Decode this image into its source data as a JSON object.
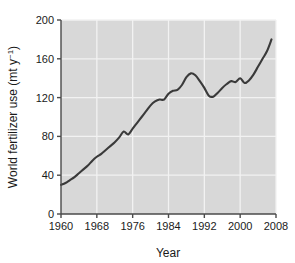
{
  "chart_data": {
    "type": "line",
    "title": "",
    "xlabel": "Year",
    "ylabel": "World fertilizer use (mt y-1)",
    "ylabel_main": "World fertilizer use (mt y",
    "ylabel_sup": "−1",
    "ylabel_close": ")",
    "xlim": [
      1960,
      2008
    ],
    "ylim": [
      0,
      200
    ],
    "grid": true,
    "legend": null,
    "xticks": [
      1960,
      1968,
      1976,
      1984,
      1992,
      2000,
      2008
    ],
    "xtick_labels": [
      "1960",
      "1968",
      "1976",
      "1984",
      "1992",
      "2000",
      "2008"
    ],
    "yticks": [
      0,
      40,
      80,
      120,
      160,
      200
    ],
    "ytick_labels": [
      "0",
      "40",
      "80",
      "120",
      "160",
      "200"
    ],
    "series": [
      {
        "name": "World fertilizer use",
        "color": "#3a3a3a",
        "x": [
          1960,
          1961,
          1962,
          1963,
          1964,
          1965,
          1966,
          1967,
          1968,
          1969,
          1970,
          1971,
          1972,
          1973,
          1974,
          1975,
          1976,
          1977,
          1978,
          1979,
          1980,
          1981,
          1982,
          1983,
          1984,
          1985,
          1986,
          1987,
          1988,
          1989,
          1990,
          1991,
          1992,
          1993,
          1994,
          1995,
          1996,
          1997,
          1998,
          1999,
          2000,
          2001,
          2002,
          2003,
          2004,
          2005,
          2006,
          2007
        ],
        "y": [
          30,
          32,
          35,
          38,
          42,
          46,
          50,
          55,
          59,
          62,
          66,
          70,
          74,
          79,
          85,
          82,
          88,
          94,
          100,
          106,
          112,
          116,
          118,
          118,
          124,
          127,
          128,
          133,
          141,
          145,
          143,
          137,
          130,
          122,
          121,
          125,
          130,
          134,
          137,
          136,
          140,
          135,
          138,
          144,
          152,
          160,
          168,
          180
        ]
      }
    ]
  },
  "colors": {
    "plot_background": "#d8d8d8",
    "gridline": "#f2f2f2",
    "axis": "#4a4a4a",
    "line": "#3a3a3a",
    "text": "#1a1a1a",
    "page_background": "#ffffff"
  },
  "plot_geometry": {
    "left": 61,
    "right": 276,
    "top": 20,
    "bottom": 214
  }
}
